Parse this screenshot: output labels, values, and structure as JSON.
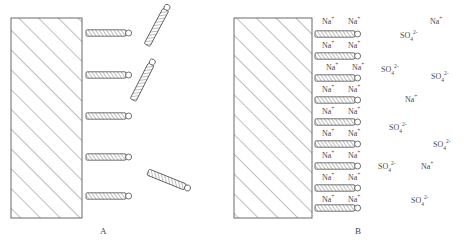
{
  "figure": {
    "title_fragment": "",
    "panels": [
      {
        "id": "A",
        "label": "A",
        "label_x": 100,
        "label_y": 226,
        "block": {
          "x": 11,
          "y": 18,
          "w": 71,
          "h": 200
        },
        "attached_rods": [
          {
            "x": 86,
            "y": 33
          },
          {
            "x": 86,
            "y": 75
          },
          {
            "x": 86,
            "y": 116
          },
          {
            "x": 86,
            "y": 157
          },
          {
            "x": 86,
            "y": 196
          }
        ],
        "free_rods": [
          {
            "x": 147,
            "y": 45,
            "angle": -62
          },
          {
            "x": 133,
            "y": 100,
            "angle": -63
          },
          {
            "x": 148,
            "y": 172,
            "angle": 22
          }
        ],
        "ions": []
      },
      {
        "id": "B",
        "label": "B",
        "label_x": 355,
        "label_y": 226,
        "block": {
          "x": 234,
          "y": 18,
          "w": 78,
          "h": 200
        },
        "attached_rods": [
          {
            "x": 315,
            "y": 34
          },
          {
            "x": 315,
            "y": 56
          },
          {
            "x": 315,
            "y": 78
          },
          {
            "x": 315,
            "y": 100
          },
          {
            "x": 315,
            "y": 122
          },
          {
            "x": 315,
            "y": 144
          },
          {
            "x": 315,
            "y": 166
          },
          {
            "x": 315,
            "y": 188
          },
          {
            "x": 315,
            "y": 208
          }
        ],
        "free_rods": [],
        "ions": [
          {
            "species": "Na",
            "charge": "+",
            "x": 322,
            "y": 18
          },
          {
            "species": "Na",
            "charge": "+",
            "x": 348,
            "y": 18
          },
          {
            "species": "Na",
            "charge": "+",
            "x": 430,
            "y": 18
          },
          {
            "species": "SO4",
            "charge": "2-",
            "x": 400,
            "y": 32
          },
          {
            "species": "Na",
            "charge": "+",
            "x": 322,
            "y": 42
          },
          {
            "species": "Na",
            "charge": "+",
            "x": 348,
            "y": 42
          },
          {
            "species": "Na",
            "charge": "+",
            "x": 326,
            "y": 64
          },
          {
            "species": "Na",
            "charge": "+",
            "x": 352,
            "y": 64
          },
          {
            "species": "SO4",
            "charge": "2-",
            "x": 381,
            "y": 66
          },
          {
            "species": "SO4",
            "charge": "2-",
            "x": 431,
            "y": 73
          },
          {
            "species": "Na",
            "charge": "+",
            "x": 322,
            "y": 86
          },
          {
            "species": "Na",
            "charge": "+",
            "x": 348,
            "y": 86
          },
          {
            "species": "Na",
            "charge": "+",
            "x": 405,
            "y": 96
          },
          {
            "species": "Na",
            "charge": "+",
            "x": 322,
            "y": 108
          },
          {
            "species": "Na",
            "charge": "+",
            "x": 348,
            "y": 108
          },
          {
            "species": "Na",
            "charge": "+",
            "x": 322,
            "y": 130
          },
          {
            "species": "Na",
            "charge": "+",
            "x": 348,
            "y": 130
          },
          {
            "species": "SO4",
            "charge": "2-",
            "x": 389,
            "y": 124
          },
          {
            "species": "Na",
            "charge": "+",
            "x": 322,
            "y": 152
          },
          {
            "species": "Na",
            "charge": "+",
            "x": 348,
            "y": 152
          },
          {
            "species": "SO4",
            "charge": "2-",
            "x": 433,
            "y": 141
          },
          {
            "species": "Na",
            "charge": "+",
            "x": 322,
            "y": 174
          },
          {
            "species": "Na",
            "charge": "+",
            "x": 348,
            "y": 174
          },
          {
            "species": "SO4",
            "charge": "2-",
            "x": 378,
            "y": 163
          },
          {
            "species": "Na",
            "charge": "+",
            "x": 421,
            "y": 163
          },
          {
            "species": "Na",
            "charge": "+",
            "x": 322,
            "y": 196
          },
          {
            "species": "Na",
            "charge": "+",
            "x": 348,
            "y": 196
          },
          {
            "species": "SO4",
            "charge": "2-",
            "x": 411,
            "y": 197
          }
        ]
      }
    ],
    "colors": {
      "line": "#5a5a5a",
      "hatch": "#7a7a7a",
      "text": "#4a4a4a",
      "background": "#ffffff"
    }
  }
}
